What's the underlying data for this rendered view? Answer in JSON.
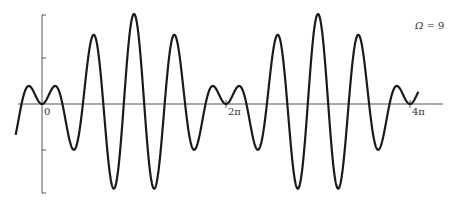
{
  "chart_data": {
    "type": "line",
    "title": "",
    "xlabel": "",
    "ylabel": "",
    "annotation": {
      "symbol": "Ω",
      "equals": " = 9",
      "Omega": 9
    },
    "x_ticks": [
      {
        "label": "0",
        "t": 0
      },
      {
        "label": "2π",
        "t": 6.2832
      },
      {
        "label": "4π",
        "t": 12.5664
      }
    ],
    "xlim": [
      -0.9,
      13.3
    ],
    "ylim": [
      -1,
      1
    ],
    "grid": false,
    "legend": null,
    "series": [
      {
        "name": "beat response",
        "formula": "x(t) = cos(4t) - cos(5t) = 2 sin(t/2) sin(9t/2)",
        "carrier_frequency": 4.5,
        "envelope_frequency": 0.5,
        "t_start": -0.9,
        "t_end": 12.85,
        "samples": 1400
      }
    ],
    "approx_peaks_px": [
      [
        71,
        62
      ],
      [
        91,
        39
      ],
      [
        111,
        23
      ],
      [
        131,
        16
      ],
      [
        150,
        19
      ],
      [
        169,
        32
      ],
      [
        189,
        50
      ],
      [
        209,
        78
      ],
      [
        237,
        93
      ],
      [
        256,
        65
      ],
      [
        276,
        42
      ],
      [
        296,
        26
      ],
      [
        316,
        19
      ],
      [
        335,
        21
      ],
      [
        354,
        34
      ],
      [
        374,
        53
      ],
      [
        395,
        80
      ],
      [
        424,
        95
      ]
    ],
    "approx_troughs_px": [
      [
        81,
        160
      ],
      [
        100,
        180
      ],
      [
        119,
        191
      ],
      [
        139,
        194
      ],
      [
        159,
        186
      ],
      [
        177,
        171
      ],
      [
        197,
        147
      ],
      [
        218,
        118
      ],
      [
        246,
        135
      ],
      [
        266,
        162
      ],
      [
        286,
        182
      ],
      [
        306,
        193
      ],
      [
        324,
        196
      ],
      [
        343,
        189
      ],
      [
        363,
        173
      ],
      [
        382,
        150
      ],
      [
        403,
        122
      ],
      [
        430,
        137
      ]
    ]
  },
  "layout": {
    "origin_x": 42,
    "axis_y": 104,
    "px_per_2pi": 184,
    "amp_px": 45,
    "vaxis_top": 15,
    "vaxis_bottom": 193,
    "vaxis_ticks_y": [
      15,
      58,
      150,
      193
    ],
    "haxis_x0": 18,
    "haxis_x1": 443,
    "colors": {
      "curve": "#1a1a1a",
      "axis": "#555555",
      "text": "#333333"
    }
  }
}
